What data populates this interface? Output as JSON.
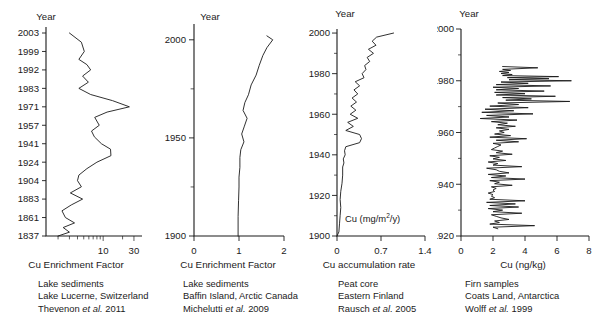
{
  "figure": {
    "year_header": "Year"
  },
  "chart_data": [
    {
      "type": "line",
      "panel_index": 0,
      "title": "",
      "xlabel": "Cu Enrichment Factor",
      "ylabel": "Year",
      "xlim": [
        1,
        40
      ],
      "xscale": "log-like",
      "xticks": [
        10,
        30
      ],
      "xtick_labels": [
        "10",
        "30"
      ],
      "ylim": [
        1830,
        2006
      ],
      "ytick_labels": [
        "2003",
        "1999",
        "1992",
        "1983",
        "1971",
        "1957",
        "1941",
        "1924",
        "1904",
        "1883",
        "1861",
        "1837"
      ],
      "ytick_years": [
        2003,
        1999,
        1992,
        1983,
        1971,
        1957,
        1941,
        1924,
        1904,
        1883,
        1861,
        1837
      ],
      "series": [
        {
          "name": "Cu Enrichment Factor",
          "years": [
            2003,
            2001,
            1999,
            1996,
            1994,
            1992,
            1989,
            1986,
            1983,
            1979,
            1975,
            1971,
            1967,
            1963,
            1957,
            1952,
            1947,
            1941,
            1936,
            1930,
            1924,
            1917,
            1910,
            1904,
            1897,
            1890,
            1883,
            1876,
            1869,
            1861,
            1854,
            1848,
            1842,
            1837
          ],
          "values": [
            3.0,
            4.6,
            5.1,
            4.2,
            5.6,
            6.4,
            4.8,
            5.9,
            4.2,
            6.4,
            14.0,
            25.5,
            11.5,
            7.4,
            8.7,
            6.6,
            7.3,
            9.4,
            13.0,
            13.2,
            8.0,
            5.6,
            4.2,
            4.0,
            4.6,
            3.1,
            4.8,
            3.2,
            2.3,
            2.6,
            3.6,
            2.4,
            3.0,
            2.0
          ]
        }
      ]
    },
    {
      "type": "line",
      "panel_index": 1,
      "title": "",
      "xlabel": "Cu Enrichment Factor",
      "ylabel": "Year",
      "xlim": [
        0,
        2
      ],
      "xticks": [
        0,
        1,
        2
      ],
      "xtick_labels": [
        "0",
        "1",
        "2"
      ],
      "ylim": [
        1900,
        2005
      ],
      "yticks": [
        1900,
        1925,
        1950,
        1975,
        2000
      ],
      "ytick_labels": [
        "1900",
        "",
        "1950",
        "",
        "2000"
      ],
      "series": [
        {
          "name": "Cu Enrichment Factor",
          "years": [
            2002,
            2000,
            1996,
            1992,
            1987,
            1982,
            1977,
            1972,
            1968,
            1964,
            1960,
            1956,
            1952,
            1948,
            1944,
            1940,
            1935,
            1930,
            1925,
            1918,
            1910,
            1900
          ],
          "values": [
            1.62,
            1.75,
            1.62,
            1.53,
            1.45,
            1.38,
            1.27,
            1.21,
            1.13,
            1.09,
            1.18,
            1.12,
            1.06,
            1.11,
            1.04,
            1.02,
            1.02,
            1.0,
            1.0,
            0.99,
            0.98,
            0.98
          ]
        }
      ]
    },
    {
      "type": "line",
      "panel_index": 2,
      "title": "",
      "xlabel": "Cu accumulation rate",
      "ylabel": "Year",
      "annotation": "Cu (mg/m2/y)",
      "annotation_base": "Cu (mg/m",
      "annotation_sup": "2",
      "annotation_tail": "/y)",
      "xlim": [
        0,
        1.4
      ],
      "xticks": [
        0,
        0.7,
        1.4
      ],
      "xtick_labels": [
        "0",
        "0.7",
        "1.4"
      ],
      "ylim": [
        1900,
        2002
      ],
      "yticks": [
        1900,
        1920,
        1940,
        1960,
        1980,
        2000
      ],
      "ytick_labels": [
        "1900",
        "1920",
        "1940",
        "1960",
        "1980",
        "2000"
      ],
      "series": [
        {
          "name": "Cu accumulation rate",
          "years": [
            2000,
            1998,
            1996,
            1994,
            1992,
            1990,
            1988,
            1986,
            1984,
            1982,
            1980,
            1978,
            1976,
            1974,
            1972,
            1970,
            1968,
            1966,
            1964,
            1962,
            1960,
            1958,
            1956,
            1954,
            1952,
            1950,
            1948,
            1946,
            1944,
            1942,
            1940,
            1938,
            1936,
            1934,
            1930,
            1926,
            1922,
            1918,
            1914,
            1910,
            1906,
            1902,
            1900
          ],
          "values": [
            0.9,
            0.63,
            0.56,
            0.62,
            0.5,
            0.58,
            0.48,
            0.52,
            0.44,
            0.46,
            0.4,
            0.43,
            0.29,
            0.36,
            0.27,
            0.33,
            0.24,
            0.31,
            0.22,
            0.3,
            0.21,
            0.33,
            0.17,
            0.26,
            0.14,
            0.36,
            0.39,
            0.36,
            0.14,
            0.12,
            0.13,
            0.1,
            0.11,
            0.09,
            0.09,
            0.08,
            0.06,
            0.05,
            0.06,
            0.05,
            0.04,
            0.03,
            0.0
          ]
        }
      ]
    },
    {
      "type": "line",
      "panel_index": 3,
      "title": "",
      "xlabel": "Cu (ng/kg)",
      "ylabel": "Year",
      "xlim": [
        0,
        8
      ],
      "xticks": [
        0,
        2,
        4,
        6,
        8
      ],
      "xtick_labels": [
        "0",
        "2",
        "4",
        "6",
        "8"
      ],
      "ylim": [
        1920,
        2000
      ],
      "yticks": [
        1920,
        1940,
        1960,
        1980,
        2000
      ],
      "ytick_labels": [
        "1920",
        "1940",
        "1960",
        "1980",
        "2000"
      ],
      "series": [
        {
          "name": "Cu (ng/kg)",
          "years": [
            1985.5,
            1985.0,
            1984.4,
            1984.0,
            1983.6,
            1983.2,
            1982.8,
            1982.4,
            1982.0,
            1981.6,
            1981.2,
            1980.8,
            1980.4,
            1980.0,
            1979.5,
            1979.0,
            1978.5,
            1978.0,
            1977.5,
            1977.0,
            1976.5,
            1976.0,
            1975.5,
            1975.0,
            1974.5,
            1974.0,
            1973.5,
            1973.0,
            1972.5,
            1972.0,
            1971.4,
            1970.8,
            1970.2,
            1969.6,
            1969.0,
            1968.4,
            1967.8,
            1967.2,
            1966.6,
            1966.0,
            1965.4,
            1964.8,
            1964.2,
            1963.6,
            1963.0,
            1962.4,
            1961.8,
            1961.2,
            1960.6,
            1960.0,
            1959.4,
            1958.8,
            1958.2,
            1957.6,
            1957.0,
            1956.4,
            1955.8,
            1955.2,
            1954.6,
            1954.0,
            1953.4,
            1952.8,
            1952.2,
            1951.6,
            1951.0,
            1950.4,
            1949.8,
            1949.2,
            1948.6,
            1948.0,
            1947.4,
            1946.8,
            1946.2,
            1945.6,
            1945.0,
            1944.4,
            1943.8,
            1943.2,
            1942.6,
            1942.0,
            1941.4,
            1940.8,
            1940.2,
            1939.6,
            1939.0,
            1938.4,
            1937.8,
            1937.2,
            1936.6,
            1936.0,
            1935.4,
            1934.8,
            1934.2,
            1933.6,
            1933.0,
            1932.4,
            1931.8,
            1931.2,
            1930.6,
            1930.0,
            1929.4,
            1928.8,
            1928.2,
            1927.6,
            1927.0,
            1926.4,
            1925.8,
            1925.2,
            1924.6,
            1924.0,
            1923.4,
            1922.8,
            1922.2
          ],
          "values": [
            2.6,
            4.8,
            2.6,
            3.1,
            2.4,
            3.0,
            2.5,
            3.2,
            2.6,
            6.1,
            2.9,
            5.5,
            3.0,
            6.9,
            2.5,
            4.2,
            2.2,
            5.6,
            2.0,
            3.6,
            2.2,
            5.2,
            2.1,
            4.0,
            2.2,
            5.9,
            2.6,
            4.4,
            2.8,
            6.8,
            2.3,
            3.6,
            1.8,
            4.2,
            1.5,
            3.3,
            1.3,
            4.5,
            1.6,
            3.0,
            1.2,
            3.5,
            1.9,
            2.9,
            2.3,
            3.4,
            2.2,
            3.0,
            2.4,
            2.7,
            2.1,
            3.1,
            1.8,
            4.1,
            2.2,
            3.6,
            2.0,
            2.5,
            2.3,
            2.1,
            1.9,
            2.6,
            2.2,
            3.2,
            1.8,
            2.4,
            2.0,
            2.8,
            1.7,
            2.3,
            2.0,
            3.8,
            1.6,
            2.2,
            2.4,
            3.0,
            1.7,
            2.8,
            1.9,
            4.0,
            1.8,
            2.4,
            2.1,
            3.2,
            1.9,
            2.2,
            2.0,
            2.1,
            1.7,
            2.0,
            1.9,
            2.1,
            1.8,
            4.0,
            1.6,
            3.4,
            1.8,
            3.6,
            1.7,
            2.6,
            2.0,
            3.8,
            1.9,
            2.2,
            2.5,
            3.0,
            2.1,
            2.4,
            1.8,
            4.6,
            2.0,
            2.3
          ]
        }
      ]
    }
  ],
  "captions": [
    {
      "line1": "Lake sediments",
      "line2": "Lake Lucerne, Switzerland",
      "author": "Thevenon",
      "etal": "et al.",
      "year": "2011"
    },
    {
      "line1": "Lake sediments",
      "line2": "Baffin Island, Arctic Canada",
      "author": "Michelutti",
      "etal": "et al.",
      "year": "2009"
    },
    {
      "line1": "Peat core",
      "line2": "Eastern Finland",
      "author": "Rausch",
      "etal": "et al.",
      "year": "2005"
    },
    {
      "line1": "Firn samples",
      "line2": "Coats Land, Antarctica",
      "author": "Wolff",
      "etal": "et al.",
      "year": "1999"
    }
  ]
}
